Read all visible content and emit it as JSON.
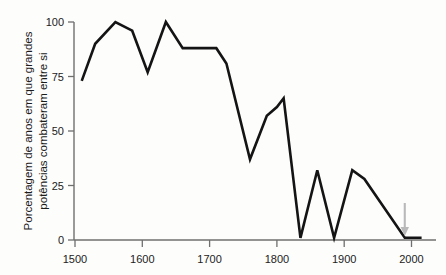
{
  "chart_data": {
    "type": "line",
    "title": "",
    "xlabel": "",
    "ylabel_line1": "Porcentagem de anos em que grandes",
    "ylabel_line2": "potências combateram entre si",
    "xlim": [
      1500,
      2025
    ],
    "ylim": [
      0,
      100
    ],
    "grid": false,
    "legend": "none",
    "xticks": [
      1500,
      1600,
      1700,
      1800,
      1900,
      2000
    ],
    "xtick_labels": [
      "1500",
      "1600",
      "1700",
      "1800",
      "1900",
      "2000"
    ],
    "yticks": [
      0,
      25,
      50,
      75,
      100
    ],
    "ytick_labels": [
      "0",
      "25",
      "50",
      "75",
      "100"
    ],
    "series": [
      {
        "name": "Porcentagem de anos com combate entre grandes potências",
        "color": "#141414",
        "x": [
          1510,
          1530,
          1560,
          1585,
          1608,
          1635,
          1660,
          1710,
          1725,
          1760,
          1785,
          1800,
          1810,
          1835,
          1860,
          1885,
          1912,
          1930,
          1990,
          2015
        ],
        "y": [
          73,
          90,
          100,
          96,
          77,
          100,
          88,
          88,
          81,
          37,
          57,
          61,
          65,
          1,
          32,
          1,
          32,
          28,
          1,
          1
        ]
      }
    ],
    "annotations": [
      {
        "name": "present-day-arrow",
        "type": "arrow-down",
        "x": 1990,
        "color": "#b9b9b9",
        "label": ""
      }
    ]
  },
  "axes": {
    "y_axis_name": "y-axis",
    "x_axis_name": "x-axis"
  }
}
